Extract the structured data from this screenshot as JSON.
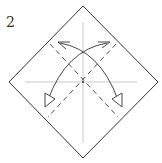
{
  "diagram": {
    "step_number": "2",
    "type": "origami-fold-instruction",
    "elements": [
      "square-diamond-paper",
      "horizontal-crease",
      "vertical-crease",
      "two-valley-fold-dashed-lines",
      "two-curved-fold-arrows"
    ],
    "colors": {
      "line": "#333333",
      "crease": "#bbbbbb",
      "background": "#ffffff"
    }
  }
}
